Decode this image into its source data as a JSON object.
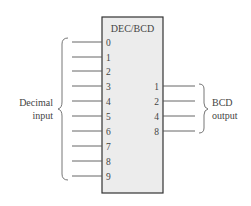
{
  "diagram": {
    "block_title": "DEC/BCD",
    "box_fill": "#ececec",
    "box_stroke": "#333333",
    "inputs": [
      "0",
      "1",
      "2",
      "3",
      "4",
      "5",
      "6",
      "7",
      "8",
      "9"
    ],
    "outputs": [
      "1",
      "2",
      "4",
      "8"
    ],
    "input_group_label": [
      "Decimal",
      "input"
    ],
    "output_group_label": [
      "BCD",
      "output"
    ]
  }
}
